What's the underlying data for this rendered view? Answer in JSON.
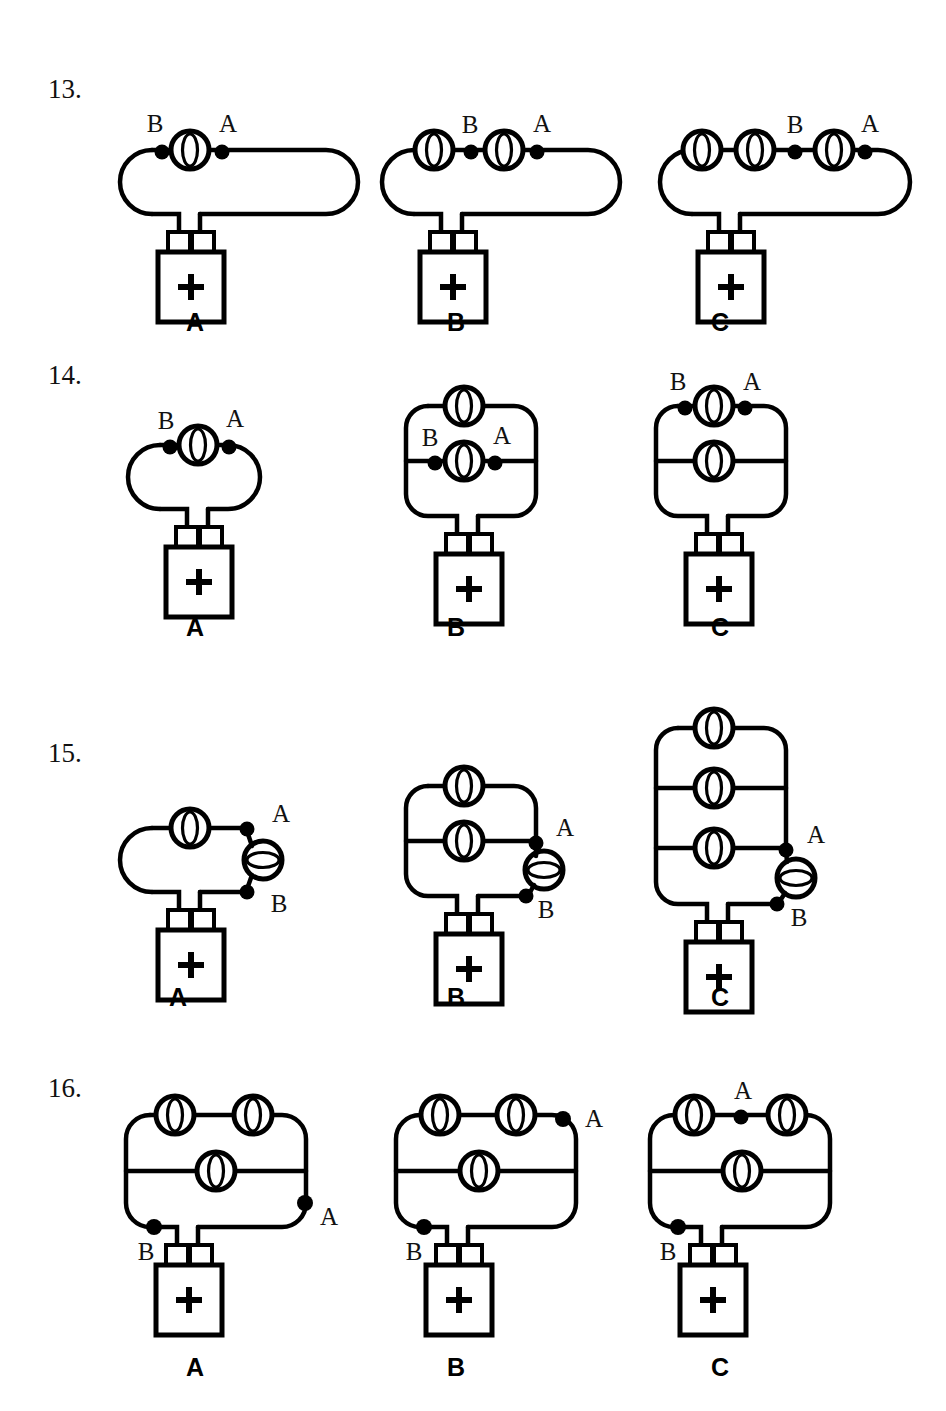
{
  "page": {
    "kind": "physics-worksheet-circuit-diagrams",
    "background": "#ffffff",
    "ink": "#000000",
    "width": 946,
    "height": 1411
  },
  "questions": [
    {
      "id": "q13",
      "number": "13.",
      "x": 48,
      "y": 76
    },
    {
      "id": "q14",
      "number": "14.",
      "x": 48,
      "y": 362
    },
    {
      "id": "q15",
      "number": "15.",
      "x": 48,
      "y": 740
    },
    {
      "id": "q16",
      "number": "16.",
      "x": 48,
      "y": 1075
    }
  ],
  "option_labels": {
    "a": "A",
    "b": "B",
    "c": "C"
  },
  "node_labels": {
    "a": "A",
    "b": "B"
  },
  "battery": {
    "polarity_symbol": "+"
  },
  "icons": {
    "bulb_vertical": "light-bulb-icon",
    "bulb_horizontal": "light-bulb-rotated-icon",
    "battery": "battery-icon",
    "node_dot": "circuit-node-dot-icon",
    "plus": "plus-symbol-icon"
  },
  "rows": [
    {
      "id": "row-13",
      "number": "13.",
      "label_y": 322,
      "circuits": [
        {
          "option": "A",
          "label_x": 195,
          "bulbs_series": 1,
          "branches": 1,
          "node_dots": [
            "B",
            "A"
          ]
        },
        {
          "option": "B",
          "label_x": 455,
          "bulbs_series": 2,
          "branches": 1,
          "node_dots": [
            "B",
            "A"
          ]
        },
        {
          "option": "C",
          "label_x": 720,
          "bulbs_series": 3,
          "branches": 1,
          "node_dots": [
            "B",
            "A"
          ]
        }
      ]
    },
    {
      "id": "row-14",
      "number": "14.",
      "label_y": 628,
      "circuits": [
        {
          "option": "A",
          "label_x": 195,
          "branches": 1,
          "bulbs_per_branch": [
            1
          ],
          "node_dots": [
            "B",
            "A"
          ]
        },
        {
          "option": "B",
          "label_x": 455,
          "branches": 2,
          "bulbs_per_branch": [
            1,
            1
          ],
          "node_dots": [
            "B",
            "A"
          ]
        },
        {
          "option": "C",
          "label_x": 720,
          "branches": 2,
          "bulbs_per_branch": [
            1,
            1
          ],
          "node_dots": [
            "B",
            "A"
          ]
        }
      ]
    },
    {
      "id": "row-15",
      "number": "15.",
      "label_y": 1000,
      "circuits": [
        {
          "option": "A",
          "label_x": 153,
          "branches": 1,
          "side_bulb": true,
          "node_dots": [
            "A",
            "B"
          ]
        },
        {
          "option": "B",
          "label_x": 455,
          "branches": 2,
          "side_bulb": true,
          "node_dots": [
            "A",
            "B"
          ]
        },
        {
          "option": "C",
          "label_x": 720,
          "branches": 3,
          "side_bulb": true,
          "node_dots": [
            "A",
            "B"
          ]
        }
      ]
    },
    {
      "id": "row-16",
      "number": "16.",
      "label_y": 1370,
      "circuits": [
        {
          "option": "A",
          "label_x": 195,
          "branches": 2,
          "top_bulbs": 2,
          "mid_bulbs": 1,
          "node_dots": [
            "A",
            "B"
          ]
        },
        {
          "option": "B",
          "label_x": 455,
          "branches": 2,
          "top_bulbs": 2,
          "mid_bulbs": 1,
          "node_dots": [
            "A",
            "B"
          ]
        },
        {
          "option": "C",
          "label_x": 720,
          "branches": 2,
          "top_bulbs": 2,
          "mid_bulbs": 1,
          "node_dots": [
            "A",
            "B"
          ]
        }
      ]
    }
  ]
}
